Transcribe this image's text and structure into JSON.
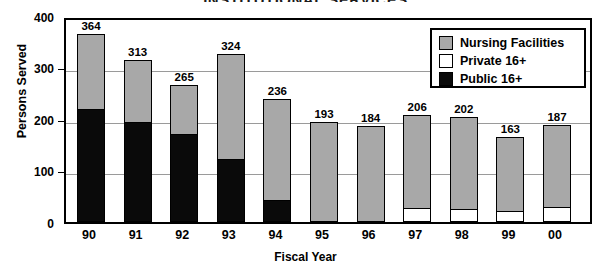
{
  "chart_data": {
    "type": "bar",
    "subtype": "stacked",
    "title": "INSTITUTIONAL SERVICES",
    "xlabel": "Fiscal Year",
    "ylabel": "Persons Served",
    "ylim": [
      0,
      400
    ],
    "yticks": [
      0,
      100,
      200,
      300,
      400
    ],
    "grid": true,
    "legend_position": "top-right",
    "categories": [
      "90",
      "91",
      "92",
      "93",
      "94",
      "95",
      "96",
      "97",
      "98",
      "99",
      "00"
    ],
    "totals": [
      364,
      313,
      265,
      324,
      236,
      193,
      184,
      206,
      202,
      163,
      187
    ],
    "series": [
      {
        "name": "Public 16+",
        "color": "#0a0a0a",
        "values": [
          218,
          192,
          168,
          120,
          40,
          0,
          0,
          0,
          0,
          0,
          0
        ]
      },
      {
        "name": "Private 16+",
        "color": "#ffffff",
        "values": [
          0,
          0,
          0,
          0,
          0,
          0,
          0,
          25,
          23,
          20,
          27
        ]
      },
      {
        "name": "Nursing Facilities",
        "color": "#a8a8a8",
        "values": [
          146,
          121,
          97,
          204,
          196,
          193,
          184,
          181,
          179,
          143,
          160
        ]
      }
    ],
    "datalabels": [
      "364",
      "313",
      "265",
      "324",
      "236",
      "193",
      "184",
      "206",
      "202",
      "163",
      "187"
    ]
  },
  "axis": {
    "y_tick_labels": [
      "400",
      "300",
      "200",
      "100",
      "0"
    ],
    "x_tick_labels": [
      "90",
      "91",
      "92",
      "93",
      "94",
      "95",
      "96",
      "97",
      "98",
      "99",
      "00"
    ]
  },
  "legend": {
    "items": [
      {
        "label": "Nursing Facilities",
        "swatch": "gray"
      },
      {
        "label": "Private 16+",
        "swatch": "white"
      },
      {
        "label": "Public 16+",
        "swatch": "black"
      }
    ]
  }
}
